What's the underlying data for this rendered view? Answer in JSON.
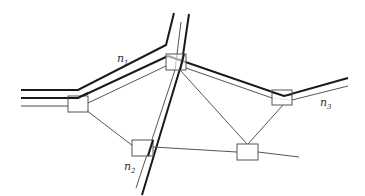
{
  "diagram": {
    "type": "road network with nodes",
    "colors": {
      "road_thick": "#1a1a1a",
      "road_thin": "#555555",
      "link": "#555555",
      "node_border": "#555555",
      "node_fill": "#ffffff",
      "label": "#333333"
    },
    "labels": [
      {
        "id": "n1",
        "base": "n",
        "sub": "1",
        "x": 117,
        "y": 62
      },
      {
        "id": "n2",
        "base": "n",
        "sub": "2",
        "x": 124,
        "y": 170
      },
      {
        "id": "n3",
        "base": "n",
        "sub": "3",
        "x": 320,
        "y": 106
      }
    ],
    "nodes": [
      {
        "id": "A",
        "x": 68,
        "y": 96,
        "w": 20,
        "h": 16
      },
      {
        "id": "B",
        "x": 166,
        "y": 54,
        "w": 20,
        "h": 16
      },
      {
        "id": "C",
        "x": 272,
        "y": 90,
        "w": 20,
        "h": 15
      },
      {
        "id": "D",
        "x": 132,
        "y": 140,
        "w": 21,
        "h": 16
      },
      {
        "id": "E",
        "x": 237,
        "y": 144,
        "w": 21,
        "h": 16
      }
    ]
  }
}
